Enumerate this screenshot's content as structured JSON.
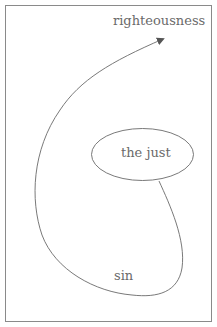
{
  "diagram": {
    "labels": {
      "top": "righteousness",
      "ellipse": "the just",
      "bottom": "sin"
    },
    "colors": {
      "stroke": "#6a6a6a",
      "frame": "#8a8a8a",
      "text": "#6a6a6a"
    }
  }
}
